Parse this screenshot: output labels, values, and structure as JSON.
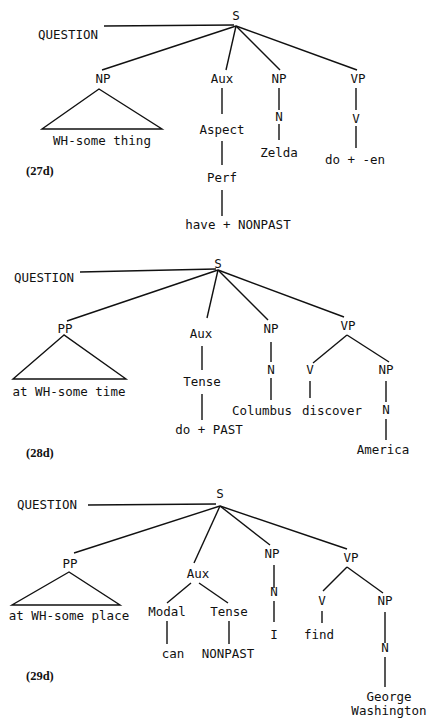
{
  "trees": [
    {
      "id": "27d",
      "example_label": "(27d)",
      "label_pos": [
        26,
        175
      ],
      "nodes": [
        {
          "id": "S",
          "text": "S",
          "x": 236,
          "y": 20
        },
        {
          "id": "Q",
          "text": "QUESTION",
          "x": 68,
          "y": 39
        },
        {
          "id": "NP1",
          "text": "NP",
          "x": 103,
          "y": 83
        },
        {
          "id": "Aux",
          "text": "Aux",
          "x": 222,
          "y": 83
        },
        {
          "id": "NP2",
          "text": "NP",
          "x": 279,
          "y": 83
        },
        {
          "id": "VP",
          "text": "VP",
          "x": 358,
          "y": 83
        },
        {
          "id": "NP1t",
          "text": "WH-some thing",
          "x": 102,
          "y": 145
        },
        {
          "id": "Aspect",
          "text": "Aspect",
          "x": 222,
          "y": 134
        },
        {
          "id": "N",
          "text": "N",
          "x": 279,
          "y": 121
        },
        {
          "id": "V",
          "text": "V",
          "x": 356,
          "y": 123
        },
        {
          "id": "Zelda",
          "text": "Zelda",
          "x": 279,
          "y": 157
        },
        {
          "id": "doen",
          "text": "do + -en",
          "x": 355,
          "y": 164
        },
        {
          "id": "Perf",
          "text": "Perf",
          "x": 222,
          "y": 182
        },
        {
          "id": "have",
          "text": "have + NONPAST",
          "x": 238,
          "y": 229
        }
      ],
      "edges": [
        [
          104,
          26,
          234,
          25
        ],
        [
          236,
          26,
          102,
          70
        ],
        [
          236,
          26,
          226,
          70
        ],
        [
          236,
          26,
          280,
          70
        ],
        [
          236,
          26,
          357,
          70
        ],
        [
          222,
          88,
          222,
          114
        ],
        [
          279,
          88,
          279,
          110
        ],
        [
          279,
          124,
          279,
          140
        ],
        [
          356,
          88,
          356,
          110
        ],
        [
          356,
          126,
          356,
          148
        ],
        [
          222,
          141,
          222,
          165
        ],
        [
          222,
          190,
          222,
          216
        ]
      ],
      "triangles": [
        [
          99,
          89,
          42,
          129,
          162,
          129
        ]
      ]
    },
    {
      "id": "28d",
      "example_label": "(28d)",
      "label_pos": [
        26,
        457
      ],
      "nodes": [
        {
          "id": "S",
          "text": "S",
          "x": 218,
          "y": 268
        },
        {
          "id": "Q",
          "text": "QUESTION",
          "x": 44,
          "y": 282
        },
        {
          "id": "PP",
          "text": "PP",
          "x": 65,
          "y": 333
        },
        {
          "id": "Aux",
          "text": "Aux",
          "x": 201,
          "y": 338
        },
        {
          "id": "NP",
          "text": "NP",
          "x": 271,
          "y": 333
        },
        {
          "id": "VP",
          "text": "VP",
          "x": 348,
          "y": 330
        },
        {
          "id": "PPt",
          "text": "at WH-some time",
          "x": 69,
          "y": 396
        },
        {
          "id": "Tense",
          "text": "Tense",
          "x": 202,
          "y": 386
        },
        {
          "id": "N",
          "text": "N",
          "x": 271,
          "y": 374
        },
        {
          "id": "V",
          "text": "V",
          "x": 310,
          "y": 374
        },
        {
          "id": "NPo",
          "text": "NP",
          "x": 386,
          "y": 374
        },
        {
          "id": "Columbus",
          "text": "Columbus",
          "x": 262,
          "y": 415
        },
        {
          "id": "discover",
          "text": "discover",
          "x": 332,
          "y": 415
        },
        {
          "id": "N2",
          "text": "N",
          "x": 386,
          "y": 414
        },
        {
          "id": "doPast",
          "text": "do + PAST",
          "x": 209,
          "y": 434
        },
        {
          "id": "America",
          "text": "America",
          "x": 383,
          "y": 454
        }
      ],
      "edges": [
        [
          80,
          272,
          216,
          269
        ],
        [
          218,
          270,
          67,
          321
        ],
        [
          218,
          270,
          207,
          318
        ],
        [
          218,
          270,
          268,
          320
        ],
        [
          218,
          270,
          344,
          317
        ],
        [
          202,
          346,
          202,
          370
        ],
        [
          271,
          342,
          271,
          362
        ],
        [
          271,
          378,
          271,
          400
        ],
        [
          347,
          335,
          313,
          363
        ],
        [
          347,
          335,
          389,
          362
        ],
        [
          310,
          381,
          310,
          398
        ],
        [
          386,
          381,
          386,
          402
        ],
        [
          386,
          419,
          386,
          440
        ],
        [
          202,
          394,
          202,
          420
        ]
      ],
      "triangles": [
        [
          64,
          335,
          13,
          379,
          126,
          379
        ]
      ]
    },
    {
      "id": "29d",
      "example_label": "(29d)",
      "label_pos": [
        26,
        680
      ],
      "nodes": [
        {
          "id": "S",
          "text": "S",
          "x": 220,
          "y": 498
        },
        {
          "id": "Q",
          "text": "QUESTION",
          "x": 47,
          "y": 509
        },
        {
          "id": "PP",
          "text": "PP",
          "x": 70,
          "y": 568
        },
        {
          "id": "Aux",
          "text": "Aux",
          "x": 198,
          "y": 578
        },
        {
          "id": "NP",
          "text": "NP",
          "x": 272,
          "y": 558
        },
        {
          "id": "VP",
          "text": "VP",
          "x": 351,
          "y": 562
        },
        {
          "id": "PPt",
          "text": "at WH-some place",
          "x": 69,
          "y": 620
        },
        {
          "id": "Modal",
          "text": "Modal",
          "x": 167,
          "y": 616
        },
        {
          "id": "Tense",
          "text": "Tense",
          "x": 229,
          "y": 616
        },
        {
          "id": "N",
          "text": "N",
          "x": 274,
          "y": 596
        },
        {
          "id": "V",
          "text": "V",
          "x": 322,
          "y": 605
        },
        {
          "id": "NPo",
          "text": "NP",
          "x": 385,
          "y": 605
        },
        {
          "id": "can",
          "text": "can",
          "x": 173,
          "y": 658
        },
        {
          "id": "NONPAST",
          "text": "NONPAST",
          "x": 228,
          "y": 658
        },
        {
          "id": "I",
          "text": "I",
          "x": 274,
          "y": 639
        },
        {
          "id": "find",
          "text": "find",
          "x": 319,
          "y": 639
        },
        {
          "id": "N2",
          "text": "N",
          "x": 385,
          "y": 652
        },
        {
          "id": "George",
          "text": "George",
          "x": 389,
          "y": 701
        },
        {
          "id": "Washington",
          "text": "Washington",
          "x": 389,
          "y": 715
        }
      ],
      "edges": [
        [
          88,
          505,
          216,
          504
        ],
        [
          220,
          506,
          74,
          553
        ],
        [
          220,
          506,
          194,
          563
        ],
        [
          220,
          506,
          270,
          545
        ],
        [
          220,
          506,
          347,
          549
        ],
        [
          274,
          565,
          274,
          588
        ],
        [
          274,
          601,
          274,
          622
        ],
        [
          191,
          583,
          167,
          603
        ],
        [
          199,
          583,
          228,
          603
        ],
        [
          167,
          621,
          167,
          644
        ],
        [
          229,
          621,
          229,
          644
        ],
        [
          347,
          567,
          323,
          591
        ],
        [
          347,
          567,
          383,
          593
        ],
        [
          322,
          611,
          322,
          623
        ],
        [
          385,
          612,
          385,
          643
        ],
        [
          385,
          657,
          385,
          687
        ]
      ],
      "triangles": [
        [
          69,
          572,
          12,
          605,
          120,
          605
        ]
      ]
    }
  ]
}
